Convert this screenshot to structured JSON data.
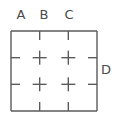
{
  "figure": {
    "name": "grid-square-diagram",
    "background_color": "#ffffff",
    "line_color": "#5a5a5a",
    "text_color": "#4a4a4a",
    "square": {
      "left": 11,
      "top": 31,
      "right": 97,
      "bottom": 111
    },
    "divisions": 3,
    "tick_length": 9,
    "cross_arm": 7
  },
  "labels": {
    "top": [
      {
        "text": "A",
        "x": 21,
        "y": 15
      },
      {
        "text": "B",
        "x": 44,
        "y": 15
      },
      {
        "text": "C",
        "x": 69,
        "y": 15
      }
    ],
    "right": [
      {
        "text": "D",
        "x": 106,
        "y": 70
      }
    ]
  },
  "grid": {
    "column_positions": [
      11,
      39.67,
      68.33,
      97
    ],
    "row_positions": [
      31,
      57.67,
      84.33,
      111
    ],
    "interior_columns": [
      39.67,
      68.33
    ],
    "interior_rows": [
      57.67,
      84.33
    ],
    "crosses": [
      {
        "x": 39.67,
        "y": 57.67
      },
      {
        "x": 68.33,
        "y": 57.67
      },
      {
        "x": 39.67,
        "y": 84.33
      },
      {
        "x": 68.33,
        "y": 84.33
      }
    ]
  }
}
